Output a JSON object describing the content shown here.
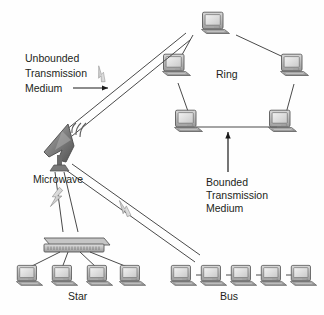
{
  "diagram": {
    "title_labels": {
      "unbounded": "Unbounded\nTransmission\nMedium",
      "unbounded_line1": "Unbounded",
      "unbounded_line2": "Transmission",
      "unbounded_line3": "Medium",
      "bounded_line1": "Bounded",
      "bounded_line2": "Transmission",
      "bounded_line3": "Medium"
    },
    "topologies": [
      {
        "id": "ring",
        "label": "Ring",
        "node_count": 5,
        "node_type": "computer"
      },
      {
        "id": "star",
        "label": "Star",
        "node_count": 4,
        "node_type": "computer",
        "hub": "hub-switch"
      },
      {
        "id": "bus",
        "label": "Bus",
        "node_count": 5,
        "node_type": "computer"
      }
    ],
    "devices": [
      {
        "id": "microwave",
        "label": "Microwave",
        "icon": "satellite-dish-icon"
      }
    ],
    "wireless_links": [
      {
        "from": "microwave",
        "to": "ring",
        "icon": "lightning-bolt-icon"
      },
      {
        "from": "microwave",
        "to": "star",
        "icon": "lightning-bolt-icon"
      },
      {
        "from": "microwave",
        "to": "bus",
        "icon": "lightning-bolt-icon"
      }
    ],
    "colors": {
      "line": "#4a4a4a",
      "annotation": "#1a1a1a",
      "text": "#231f20",
      "device_fill_light": "#e8e8e8",
      "device_fill_mid": "#b9b9b9",
      "device_fill_dark": "#8a8a8a",
      "device_stroke": "#5a5a5a",
      "background": "#fefefe"
    }
  }
}
